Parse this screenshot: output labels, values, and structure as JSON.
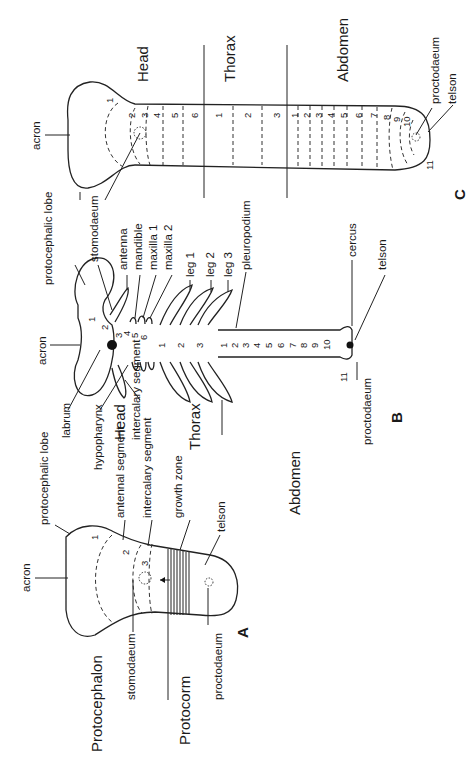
{
  "figure": {
    "orientation": "rotated 90° counter-clockwise (text reads bottom-to-top)",
    "panels": {
      "A": {
        "letter": "A",
        "region_labels": [
          "Protocephalon",
          "Protocorm"
        ],
        "labels": {
          "acron": "acron",
          "protocephalic_lobe": "protocephalic lobe",
          "antennal_segment": "antennal segment",
          "intercalary_segment": "intercalary segment",
          "growth_zone": "growth zone",
          "telson": "telson",
          "stomodaeum": "stomodaeum",
          "proctodaeum": "proctodaeum"
        },
        "segment_numbers": [
          "1",
          "2",
          "3"
        ]
      },
      "B": {
        "letter": "B",
        "region_labels": [
          "Head",
          "Thorax",
          "Abdomen"
        ],
        "labels": {
          "protocephalic_lobe": "protocephalic lobe",
          "stomodaeum": "stomodaeum",
          "antenna": "antenna",
          "mandible": "mandible",
          "maxilla_1": "maxilla 1",
          "maxilla_2": "maxilla 2",
          "leg_1": "leg 1",
          "leg_2": "leg 2",
          "leg_3": "leg 3",
          "pleuropodium": "pleuropodium",
          "acron": "acron",
          "labrum": "labrum",
          "hypopharynx": "hypopharynx",
          "intercalary_segment": "intercalary segment",
          "cercus": "cercus",
          "telson": "telson",
          "proctodaeum": "proctodaeum"
        },
        "head_segment_numbers": [
          "1",
          "2",
          "3",
          "4",
          "5",
          "6"
        ],
        "thorax_segment_numbers": [
          "1",
          "2",
          "3"
        ],
        "abdomen_segment_numbers": [
          "1",
          "2",
          "3",
          "4",
          "5",
          "6",
          "7",
          "8",
          "9",
          "10",
          "11"
        ]
      },
      "C": {
        "letter": "C",
        "region_labels": [
          "Head",
          "Thorax",
          "Abdomen"
        ],
        "labels": {
          "acron": "acron",
          "proctodaeum": "proctodaeum",
          "telson": "telson"
        },
        "head_segment_numbers": [
          "1",
          "2",
          "3",
          "4",
          "5",
          "6"
        ],
        "thorax_segment_numbers": [
          "1",
          "2",
          "3"
        ],
        "abdomen_segment_numbers": [
          "1",
          "2",
          "3",
          "4",
          "5",
          "6",
          "7",
          "8",
          "9",
          "10",
          "11"
        ]
      }
    }
  }
}
